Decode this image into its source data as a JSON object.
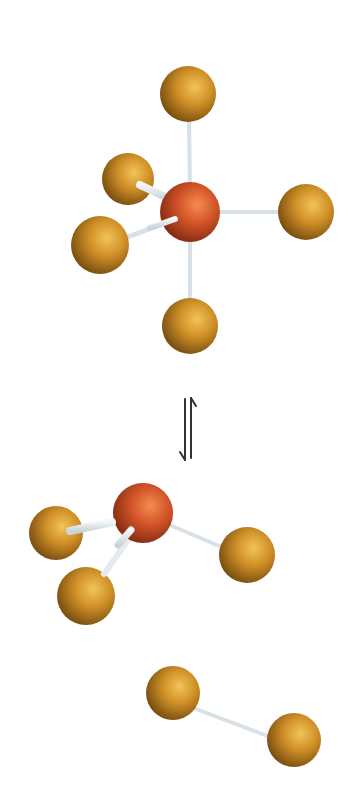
{
  "colors": {
    "background": "#ffffff",
    "central_atom": "#d2552a",
    "central_atom_dark": "#8a2e14",
    "central_atom_light": "#f08a55",
    "ligand_atom": "#c98a22",
    "ligand_atom_dark": "#7a4e10",
    "ligand_atom_light": "#f0c060",
    "bond": "#dfe6ea",
    "arrow": "#333333"
  },
  "molecules": [
    {
      "name": "AX5",
      "geometry": "trigonal bipyramidal",
      "central": {
        "x": 190,
        "y": 212,
        "r": 30
      },
      "ligands": [
        {
          "id": "axial-top",
          "x": 188,
          "y": 94,
          "r": 28
        },
        {
          "id": "equatorial-back-left",
          "x": 128,
          "y": 179,
          "r": 26
        },
        {
          "id": "equatorial-front-left",
          "x": 100,
          "y": 245,
          "r": 29
        },
        {
          "id": "equatorial-right",
          "x": 306,
          "y": 212,
          "r": 28
        },
        {
          "id": "axial-bottom",
          "x": 190,
          "y": 326,
          "r": 28
        }
      ]
    },
    {
      "name": "AX3",
      "geometry": "trigonal pyramidal",
      "central": {
        "x": 143,
        "y": 513,
        "r": 30
      },
      "ligands": [
        {
          "id": "left",
          "x": 56,
          "y": 533,
          "r": 27
        },
        {
          "id": "lower-left",
          "x": 86,
          "y": 596,
          "r": 29
        },
        {
          "id": "right",
          "x": 247,
          "y": 555,
          "r": 28
        }
      ]
    },
    {
      "name": "X2",
      "geometry": "linear diatomic",
      "atoms": [
        {
          "id": "atom-1",
          "x": 173,
          "y": 693,
          "r": 27
        },
        {
          "id": "atom-2",
          "x": 294,
          "y": 740,
          "r": 27
        }
      ]
    }
  ],
  "equilibrium_arrow": {
    "symbol": "⇅",
    "x_left": 185,
    "x_right": 191,
    "y_top": 398,
    "y_bottom": 460
  }
}
